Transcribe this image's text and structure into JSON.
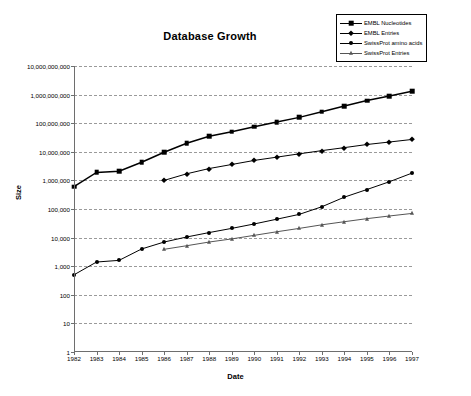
{
  "chart_data": {
    "type": "line",
    "title": "Database Growth",
    "xlabel": "Date",
    "ylabel": "Size",
    "x": [
      1982,
      1983,
      1984,
      1985,
      1986,
      1987,
      1988,
      1989,
      1990,
      1991,
      1992,
      1993,
      1994,
      1995,
      1996,
      1997
    ],
    "xlim": [
      1982,
      1997
    ],
    "ylim": [
      1,
      10000000000
    ],
    "yscale": "log",
    "ytick_labels": [
      "10,000,000,000",
      "1,000,000,000",
      "100,000,000",
      "10,000,000",
      "1,000,000",
      "100,000",
      "10,000",
      "1,000",
      "100",
      "10",
      "1"
    ],
    "ytick_values": [
      10000000000,
      1000000000,
      100000000,
      10000000,
      1000000,
      100000,
      10000,
      1000,
      100,
      10,
      1
    ],
    "xtick_labels": [
      "1982",
      "1983",
      "1984",
      "1985",
      "1986",
      "1987",
      "1988",
      "1989",
      "1990",
      "1991",
      "1992",
      "1993",
      "1994",
      "1995",
      "1996",
      "1997"
    ],
    "grid": true,
    "legend_position": "top-right",
    "series": [
      {
        "name": "EMBL Nucleotides",
        "marker": "square",
        "color": "#000000",
        "x": [
          1982,
          1983,
          1984,
          1985,
          1986,
          1987,
          1988,
          1989,
          1990,
          1991,
          1992,
          1993,
          1994,
          1995,
          1996,
          1997
        ],
        "values": [
          600000,
          1900000,
          2100000,
          4300000,
          9600000,
          20000000,
          35000000,
          50000000,
          75000000,
          110000000,
          160000000,
          250000000,
          400000000,
          620000000,
          900000000,
          1300000000
        ]
      },
      {
        "name": "EMBL Entries",
        "marker": "diamond",
        "color": "#000000",
        "x": [
          1986,
          1987,
          1988,
          1989,
          1990,
          1991,
          1992,
          1993,
          1994,
          1995,
          1996,
          1997
        ],
        "values": [
          1000000,
          1700000,
          2600000,
          3600000,
          5000000,
          6500000,
          8500000,
          11000000,
          14000000,
          18000000,
          22000000,
          27000000
        ]
      },
      {
        "name": "SwissProt amino acids",
        "marker": "circle",
        "color": "#000000",
        "x": [
          1982,
          1983,
          1984,
          1985,
          1986,
          1987,
          1988,
          1989,
          1990,
          1991,
          1992,
          1993,
          1994,
          1995,
          1996,
          1997
        ],
        "values": [
          500,
          1400,
          1600,
          4000,
          7000,
          10500,
          15000,
          21000,
          30000,
          44000,
          65000,
          120000,
          260000,
          480000,
          900000,
          1800000
        ]
      },
      {
        "name": "SwissProt Entries",
        "marker": "triangle",
        "color": "#555555",
        "x": [
          1986,
          1987,
          1988,
          1989,
          1990,
          1991,
          1992,
          1993,
          1994,
          1995,
          1996,
          1997
        ],
        "values": [
          3900,
          5200,
          7000,
          9000,
          12000,
          16000,
          21000,
          28000,
          36000,
          46000,
          57000,
          70000
        ]
      }
    ]
  }
}
